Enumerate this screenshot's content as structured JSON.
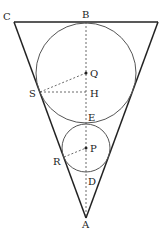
{
  "diagram": {
    "type": "geometry",
    "labels": {
      "C": "C",
      "B": "B",
      "Q": "Q",
      "S": "S",
      "H": "H",
      "E": "E",
      "P": "P",
      "R": "R",
      "D": "D",
      "A": "A"
    },
    "colors": {
      "stroke": "#222222",
      "circle": "#555555"
    }
  }
}
